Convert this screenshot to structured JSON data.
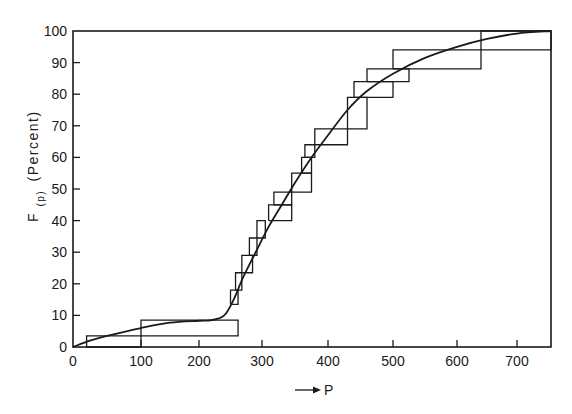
{
  "chart_data": {
    "type": "line",
    "title": "",
    "xlabel": "P",
    "xlabel_prefix_arrow": "→",
    "ylabel": "F(p) (Percent)",
    "ylabel_main": "F",
    "ylabel_subscript": "(p)",
    "ylabel_suffix": "(Percent)",
    "xlim": [
      0,
      750
    ],
    "ylim": [
      0,
      100
    ],
    "grid": false,
    "legend": null,
    "x_ticks": [
      0,
      100,
      200,
      300,
      400,
      500,
      600,
      700
    ],
    "x_tick_labels": [
      "0",
      "100",
      "200",
      "300",
      "400",
      "500",
      "600",
      "700"
    ],
    "y_ticks": [
      0,
      10,
      20,
      30,
      40,
      50,
      60,
      70,
      80,
      90,
      100
    ],
    "y_tick_labels": [
      "0",
      "10",
      "20",
      "30",
      "40",
      "50",
      "60",
      "70",
      "80",
      "90",
      "100"
    ],
    "series": [
      {
        "name": "Empirical distribution (staircase)",
        "kind": "step",
        "x": [
          0,
          20,
          100,
          260,
          255,
          260,
          265,
          280,
          290,
          305,
          320,
          340,
          355,
          370,
          380,
          430,
          460,
          500,
          540,
          640,
          750
        ],
        "steps": [
          {
            "x": 20,
            "y_from": 0,
            "y_to": 3.5,
            "x_end": 100
          },
          {
            "x": 100,
            "y_from": 3.5,
            "y_to": 8.5,
            "x_end": 262
          },
          {
            "x": 250,
            "y_from": 13.5,
            "y_to": 18,
            "x_end": 262
          },
          {
            "x": 258,
            "y_from": 18,
            "y_to": 23.5,
            "x_end": 268
          },
          {
            "x": 268,
            "y_from": 23.5,
            "y_to": 29,
            "x_end": 285
          },
          {
            "x": 280,
            "y_from": 29,
            "y_to": 34.5,
            "x_end": 292
          },
          {
            "x": 292,
            "y_from": 34.5,
            "y_to": 40,
            "x_end": 305
          },
          {
            "x": 310,
            "y_from": 40,
            "y_to": 45,
            "x_end": 345
          },
          {
            "x": 318,
            "y_from": 45,
            "y_to": 49,
            "x_end": 345
          },
          {
            "x": 345,
            "y_from": 49,
            "y_to": 55,
            "x_end": 375
          },
          {
            "x": 360,
            "y_from": 55,
            "y_to": 60,
            "x_end": 375
          },
          {
            "x": 365,
            "y_from": 60,
            "y_to": 64,
            "x_end": 380
          },
          {
            "x": 380,
            "y_from": 64,
            "y_to": 69,
            "x_end": 430
          },
          {
            "x": 430,
            "y_from": 69,
            "y_to": 79,
            "x_end": 460
          },
          {
            "x": 440,
            "y_from": 79,
            "y_to": 84,
            "x_end": 500
          },
          {
            "x": 460,
            "y_from": 84,
            "y_to": 88,
            "x_end": 525
          },
          {
            "x": 500,
            "y_from": 88,
            "y_to": 94,
            "x_end": 640
          },
          {
            "x": 640,
            "y_from": 94,
            "y_to": 100,
            "x_end": 750
          }
        ]
      },
      {
        "name": "Fitted distribution (smooth curve)",
        "kind": "smooth",
        "x": [
          0,
          25,
          50,
          100,
          150,
          200,
          220,
          240,
          255,
          270,
          290,
          310,
          330,
          350,
          375,
          400,
          430,
          460,
          500,
          550,
          600,
          650,
          700,
          750
        ],
        "y": [
          0,
          2,
          3.5,
          6,
          7.7,
          8.3,
          8.5,
          10,
          15,
          22,
          30,
          38,
          45,
          52,
          60,
          67,
          75,
          81,
          86.5,
          91.5,
          95,
          97.5,
          99.2,
          100
        ]
      }
    ]
  },
  "figure": {
    "stroke_color": "#1a1a1a",
    "background_color": "#ffffff"
  }
}
